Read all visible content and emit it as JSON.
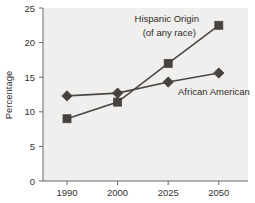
{
  "chart_data": {
    "type": "line",
    "title": "",
    "subtitle": "",
    "xlabel": "",
    "ylabel": "Percentage",
    "categories": [
      "1990",
      "2000",
      "2025",
      "2050"
    ],
    "x_tick_labels": [
      "1990",
      "2000",
      "2025",
      "2050"
    ],
    "y_tick_labels": [
      "0",
      "5",
      "10",
      "15",
      "20",
      "25"
    ],
    "y_ticks": [
      0,
      5,
      10,
      15,
      20,
      25
    ],
    "ylim": [
      0,
      25
    ],
    "grid": false,
    "legend_position": "inline-annotations",
    "series": [
      {
        "name": "Hispanic Origin (of any race)",
        "label_line1": "Hispanic Origin",
        "label_line2": "(of any race)",
        "marker": "square",
        "color": "#4a4745",
        "values": [
          9.0,
          11.4,
          17.0,
          22.5
        ]
      },
      {
        "name": "African American",
        "label_line1": "African American",
        "label_line2": "",
        "marker": "diamond",
        "color": "#4a4745",
        "values": [
          12.3,
          12.7,
          14.3,
          15.6
        ]
      }
    ]
  },
  "style": {
    "panel_background": "#f0efed",
    "figure_background": "#ffffff",
    "axis_color": "#6b6864",
    "text_color": "#33312f",
    "line_color": "#4a4745",
    "marker_fill": "#46433f"
  }
}
